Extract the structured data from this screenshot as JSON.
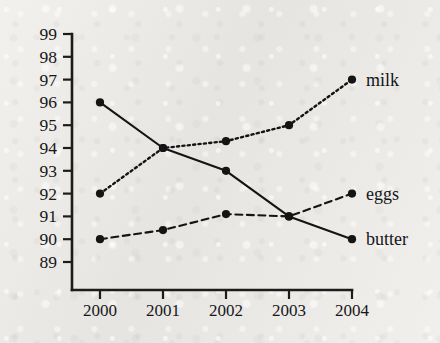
{
  "chart_data": {
    "type": "line",
    "title": "",
    "subtitle": "",
    "xlabel": "",
    "ylabel": "",
    "x": [
      2000,
      2001,
      2002,
      2003,
      2004
    ],
    "categories": [
      "2000",
      "2001",
      "2002",
      "2003",
      "2004"
    ],
    "xtick_labels": [
      "2000",
      "2001",
      "2002",
      "2003",
      "2004"
    ],
    "ytick_labels": [
      "99",
      "98",
      "97",
      "96",
      "95",
      "94",
      "93",
      "92",
      "91",
      "90",
      "89"
    ],
    "ytick_values": [
      99,
      98,
      97,
      96,
      95,
      94,
      93,
      92,
      91,
      90,
      89
    ],
    "ylim": [
      88.5,
      99.4
    ],
    "xlim": [
      1999.6,
      2004.4
    ],
    "grid": false,
    "legend_position": "inline-right",
    "marker": "filled-circle",
    "series": [
      {
        "name": "milk",
        "label": "milk",
        "line_style": "dotted",
        "color": "#141414",
        "values": [
          92,
          94,
          94.3,
          95,
          97
        ]
      },
      {
        "name": "eggs",
        "label": "eggs",
        "line_style": "dashed",
        "color": "#141414",
        "values": [
          90,
          90.4,
          91.1,
          91,
          92
        ]
      },
      {
        "name": "butter",
        "label": "butter",
        "line_style": "solid",
        "color": "#141414",
        "values": [
          96,
          94,
          93,
          91,
          90
        ]
      }
    ],
    "annotations": []
  },
  "geometry": {
    "plot_left": 72,
    "plot_right": 352,
    "plot_bottom": 290,
    "plot_top": 30,
    "y_top_value": 99,
    "y_top_px": 34,
    "y_bottom_value": 89,
    "y_bottom_px": 262,
    "x_positions": [
      100,
      163,
      226,
      289,
      352
    ],
    "tick_len": 9,
    "xtick_len": 9,
    "label_x": 366,
    "marker_radius": 4.1
  }
}
